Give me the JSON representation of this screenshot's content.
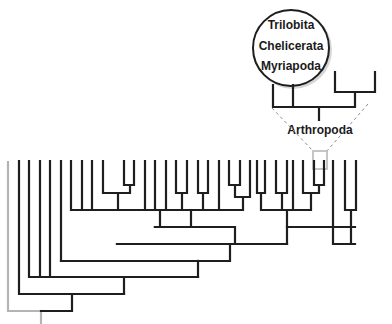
{
  "diagram": {
    "type": "phylogenetic-tree",
    "colors": {
      "branch": "#1e1e1e",
      "outgroup": "#b4b4b4",
      "dashed": "#8a8a8a",
      "highlight_box": "#b8b8b8"
    },
    "inset": {
      "bubble_lines": [
        "Trilobita",
        "Chelicerata",
        "Myriapoda"
      ],
      "clade_label": "Arthropoda"
    },
    "tree": {
      "tip_y": 161,
      "tips_x": [
        19,
        29,
        40,
        50,
        61,
        71,
        82,
        92,
        103,
        113,
        124,
        134,
        145,
        155,
        166,
        176,
        187,
        198,
        208,
        219,
        229,
        240,
        250,
        261,
        272,
        282,
        293,
        303,
        314,
        324,
        335,
        345,
        356
      ],
      "outgroup_x": 8
    }
  }
}
